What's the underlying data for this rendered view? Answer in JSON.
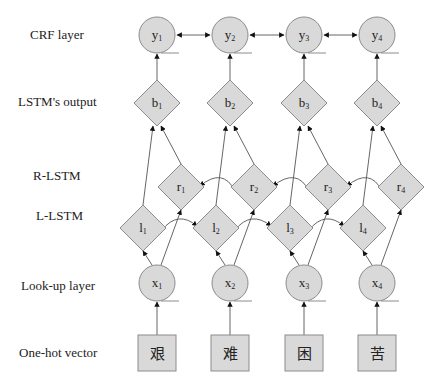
{
  "diagram": {
    "layer_labels": {
      "crf": "CRF layer",
      "lstm_output": "LSTM's output",
      "r_lstm": "R-LSTM",
      "l_lstm": "L-LSTM",
      "lookup": "Look-up layer",
      "onehot": "One-hot vector"
    },
    "crf_nodes": [
      {
        "base": "y",
        "sub": "1"
      },
      {
        "base": "y",
        "sub": "2"
      },
      {
        "base": "y",
        "sub": "3"
      },
      {
        "base": "y",
        "sub": "4"
      }
    ],
    "output_nodes": [
      {
        "base": "b",
        "sub": "1"
      },
      {
        "base": "b",
        "sub": "2"
      },
      {
        "base": "b",
        "sub": "3"
      },
      {
        "base": "b",
        "sub": "4"
      }
    ],
    "r_lstm_nodes": [
      {
        "base": "r",
        "sub": "1"
      },
      {
        "base": "r",
        "sub": "2"
      },
      {
        "base": "r",
        "sub": "3"
      },
      {
        "base": "r",
        "sub": "4"
      }
    ],
    "l_lstm_nodes": [
      {
        "base": "l",
        "sub": "1"
      },
      {
        "base": "l",
        "sub": "2"
      },
      {
        "base": "l",
        "sub": "3"
      },
      {
        "base": "l",
        "sub": "4"
      }
    ],
    "lookup_nodes": [
      {
        "base": "x",
        "sub": "1"
      },
      {
        "base": "x",
        "sub": "2"
      },
      {
        "base": "x",
        "sub": "3"
      },
      {
        "base": "x",
        "sub": "4"
      }
    ],
    "onehot_chars": [
      "艰",
      "难",
      "困",
      "苦"
    ],
    "colors": {
      "node_fill": "#d9d9d9",
      "node_stroke": "#8c8c8c",
      "edge": "#555555",
      "arrow": "#111111"
    }
  }
}
